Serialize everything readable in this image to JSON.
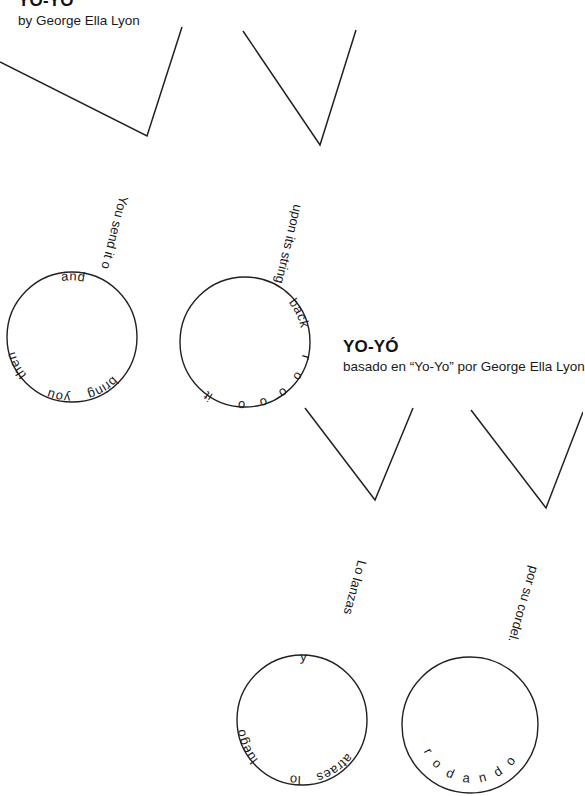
{
  "page": {
    "width": 583,
    "height": 796,
    "background": "#ffffff",
    "ink": "#231f20"
  },
  "titles": {
    "english": {
      "title": "YO-YO",
      "byline": "by George Ella Lyon"
    },
    "spanish": {
      "title": "YO-YÓ",
      "byline": "basado en “Yo-Yo” por George Ella Lyon"
    }
  },
  "yoyos": [
    {
      "id": "yoyo-english-1",
      "language": "en",
      "string_text": "You send it out",
      "circle_text": "and then you bring",
      "circle_words": [
        "and",
        "then",
        "you",
        "bring"
      ]
    },
    {
      "id": "yoyo-english-2",
      "language": "en",
      "string_text": "upon its string.",
      "circle_text": "back rooolling it",
      "circle_words": [
        "back",
        "r o o o o l l i n g",
        "it"
      ]
    },
    {
      "id": "yoyo-spanish-1",
      "language": "es",
      "string_text": "Lo lanzas",
      "circle_text": "y luego lo atraes",
      "circle_words": [
        "y",
        "luego",
        "lo",
        "atraes"
      ]
    },
    {
      "id": "yoyo-spanish-2",
      "language": "es",
      "string_text": "por su cordel.",
      "circle_text": "rodando",
      "circle_words": [
        "r o d a n d o"
      ]
    }
  ],
  "poem_lines": {
    "english": [
      "You send it out",
      "and then you bring",
      "it rooolling back",
      "upon its string."
    ],
    "spanish": [
      "Lo lanzas",
      "y luego lo atraes",
      "rodando",
      "por su cordel."
    ]
  }
}
